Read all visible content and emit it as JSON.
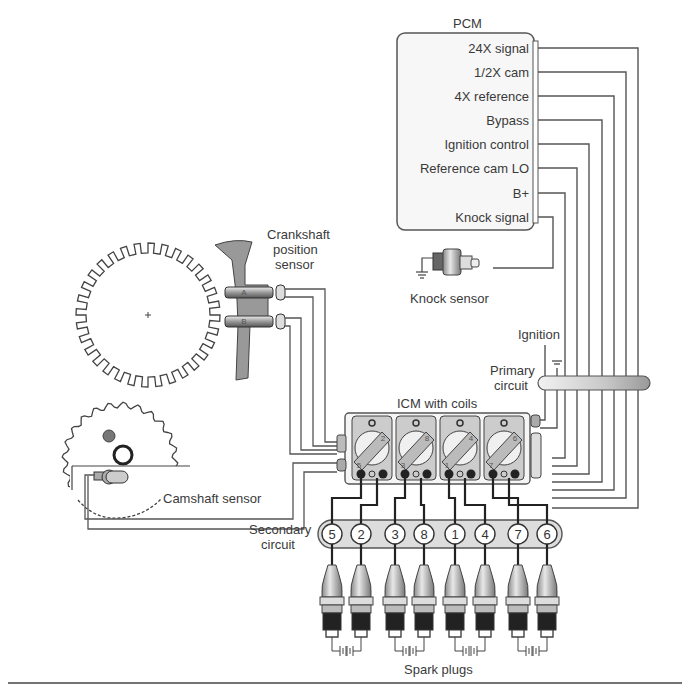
{
  "diagram": {
    "type": "ignition-system-wiring",
    "pcm": {
      "title": "PCM",
      "signals": [
        "24X signal",
        "1/2X cam",
        "4X reference",
        "Bypass",
        "Ignition control",
        "Reference cam LO",
        "B+",
        "Knock signal"
      ]
    },
    "knock_sensor": {
      "label": "Knock sensor"
    },
    "crankshaft_sensor": {
      "label_line1": "Crankshaft",
      "label_line2": "position",
      "label_line3": "sensor",
      "pickup_a": "A",
      "pickup_b": "B"
    },
    "camshaft_sensor": {
      "label": "Camshaft sensor"
    },
    "icm": {
      "label": "ICM with coils",
      "coils": [
        {
          "top": "2",
          "bottom": "5"
        },
        {
          "top": "8",
          "bottom": "3"
        },
        {
          "top": "4",
          "bottom": "1"
        },
        {
          "top": "6",
          "bottom": "7"
        }
      ]
    },
    "ignition": {
      "label": "Ignition"
    },
    "primary_circuit": {
      "line1": "Primary",
      "line2": "circuit"
    },
    "secondary_circuit": {
      "line1": "Secondary",
      "line2": "circuit",
      "cylinders": [
        "5",
        "2",
        "3",
        "8",
        "1",
        "4",
        "7",
        "6"
      ]
    },
    "spark_plugs": {
      "label": "Spark plugs",
      "count": 8
    },
    "colors": {
      "line": "#444444",
      "fill_light": "#f4f4f4",
      "fill_grey": "#b5b5b5",
      "fill_dark": "#555555"
    }
  }
}
